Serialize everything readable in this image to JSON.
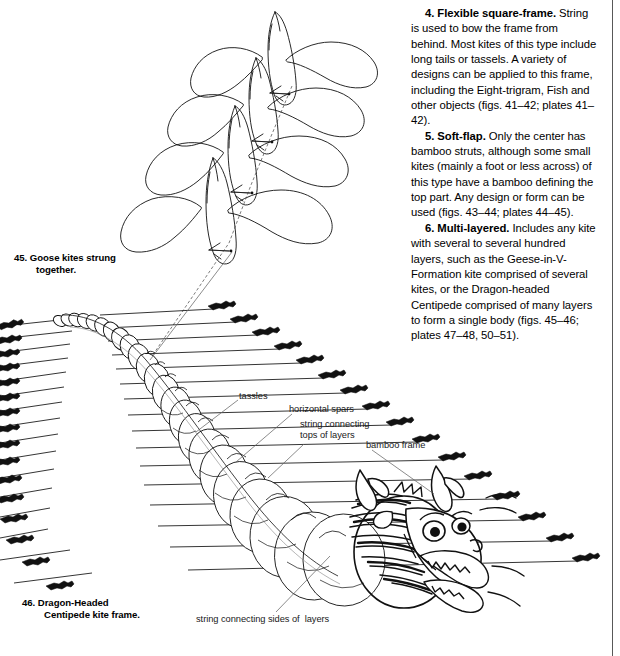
{
  "page": {
    "width": 620,
    "height": 656,
    "background": "#ffffff",
    "ink": "#000000"
  },
  "body_text": {
    "paragraphs": [
      {
        "id": "item-4",
        "lead": "4. Flexible square-frame.",
        "text": " String is used to bow the frame from behind. Most kites of this type include long tails or tassels. A variety of designs can be applied to this frame, including the Eight-trigram, Fish and other objects (figs. 41–42; plates 41–42)."
      },
      {
        "id": "item-5",
        "lead": "5. Soft-flap.",
        "text": " Only the center has bamboo struts, although some small kites (mainly a foot or less across) of this type have a bamboo defining the top part. Any design or form can be used (figs. 43–44; plates 44–45)."
      },
      {
        "id": "item-6",
        "lead": "6. Multi-layered.",
        "text": " Includes any kite with several to several hundred layers, such as the Geese-in-V-Formation kite comprised of several kites, or the Dragon-headed Centipede comprised of many layers to form a single body (figs. 45–46; plates 47–48, 50–51)."
      }
    ]
  },
  "captions": [
    {
      "id": "caption-45",
      "number": "45.",
      "line1": "Goose kites strung",
      "line2": "together."
    },
    {
      "id": "caption-46",
      "number": "46.",
      "line1": "Dragon-Headed",
      "line2": "Centipede kite frame."
    }
  ],
  "annotations": [
    {
      "id": "annot-tassles",
      "label": "tassles"
    },
    {
      "id": "annot-hspars",
      "label": "horizontal spars"
    },
    {
      "id": "annot-stringtops",
      "label": "string connecting\ntops of layers"
    },
    {
      "id": "annot-bamboo",
      "label": "bamboo frame"
    },
    {
      "id": "annot-stringsides",
      "label": "string connecting sides of  layers"
    }
  ],
  "figures": {
    "goose_kites": {
      "name": "Goose kites strung together",
      "kite_count": 4,
      "description": "Four stylized goose kites arranged diagonally, each with a long swept wing pair and a slender body, connected by a single flying line."
    },
    "centipede": {
      "name": "Dragon-Headed Centipede kite frame",
      "description": "Line-drawn frame of a dragon-headed centipede kite: a chain of circular disc layers receding to the upper-left, each crossed by a horizontal bamboo spar ending in a dark tassel, terminating at an ornate dragon head with horns, eyes, teeth and flame whiskers.",
      "disc_count": 26,
      "spar_count": 26
    }
  }
}
